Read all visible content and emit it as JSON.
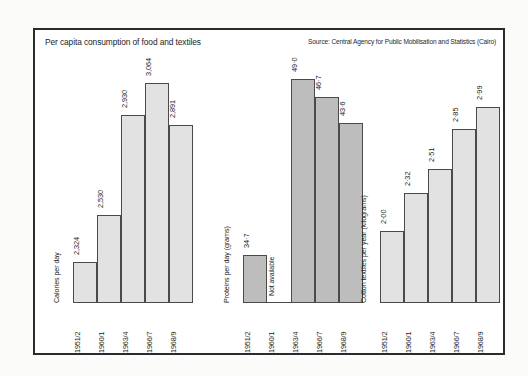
{
  "figure": {
    "title": "Per capita consumption of food and textiles",
    "source": "Source: Central Agency for Public Mobilisation and Statistics (Cairo)"
  },
  "chart_data": {
    "type": "bar",
    "title": "Per capita consumption of food and textiles",
    "subtitle": "Source: Central Agency for Public Mobilisation and Statistics (Cairo)",
    "categories": [
      "1951/2",
      "1960/1",
      "1963/4",
      "1966/7",
      "1968/9"
    ],
    "xlabel": "",
    "grid": false,
    "legend": "none",
    "panels": [
      {
        "ylabel": "Calories per day",
        "fill_color": "#e2e2e2",
        "ylim": [
          2100,
          3150
        ],
        "values": [
          2324,
          2530,
          2930,
          3064,
          2891
        ],
        "labels": [
          "2,324",
          "2,530",
          "2,930",
          "3,064",
          "2,891"
        ]
      },
      {
        "ylabel": "Proteins per day (grams)",
        "fill_color": "#bdbdbd",
        "ylim": [
          30,
          51
        ],
        "values": [
          34.7,
          null,
          49.0,
          46.7,
          43.6
        ],
        "labels": [
          "34·7",
          "Not available",
          "49·0",
          "46·7",
          "43·6"
        ]
      },
      {
        "ylabel": "Cotton textiles per year (kilograms)",
        "fill_color": "#e2e2e2",
        "ylim": [
          1.85,
          3.05
        ],
        "values": [
          2.0,
          2.32,
          2.51,
          2.85,
          2.99
        ],
        "labels": [
          "2·00",
          "2·32",
          "2·51",
          "2·85",
          "2·99"
        ]
      }
    ]
  },
  "panel_geometry": {
    "panels": [
      {
        "left": 38,
        "label_left": 26,
        "bar_width": 24,
        "gap": 0,
        "heights": [
          41,
          88,
          188,
          220,
          178
        ]
      },
      {
        "left": 208,
        "label_left": 196,
        "bar_width": 24,
        "gap": 0,
        "heights": [
          48,
          0,
          224,
          206,
          180
        ]
      },
      {
        "left": 345,
        "label_left": 333,
        "bar_width": 24,
        "gap": 0,
        "heights": [
          72,
          110,
          134,
          174,
          196
        ]
      }
    ]
  }
}
